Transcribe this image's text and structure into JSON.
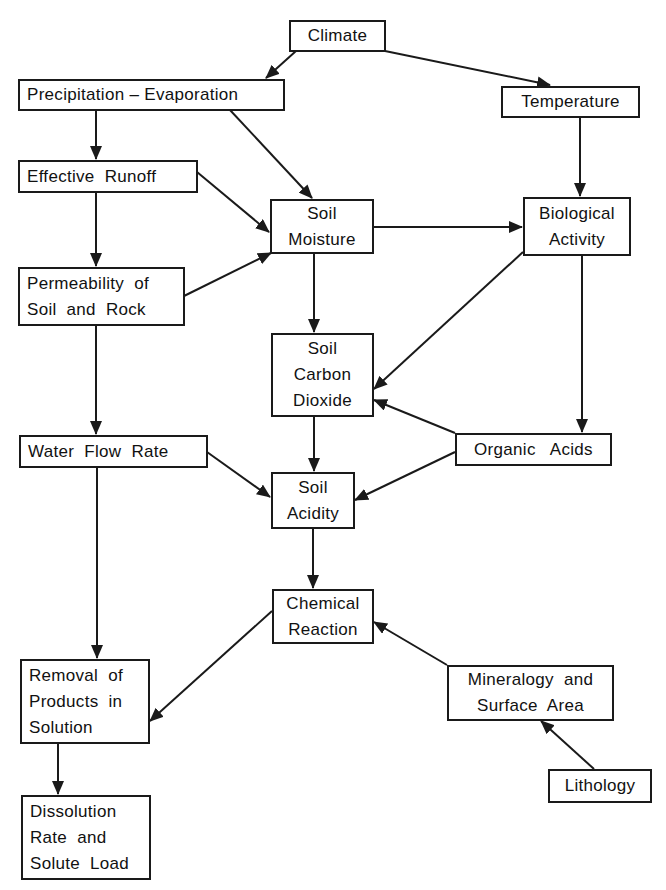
{
  "diagram": {
    "type": "flowchart",
    "nodes": [
      {
        "id": "climate",
        "lines": [
          "Climate"
        ]
      },
      {
        "id": "precip_evap",
        "lines": [
          "Precipitation – Evaporation"
        ]
      },
      {
        "id": "temperature",
        "lines": [
          "Temperature"
        ]
      },
      {
        "id": "effective_runoff",
        "lines": [
          "Effective  Runoff"
        ]
      },
      {
        "id": "soil_moisture",
        "lines": [
          "Soil",
          "Moisture"
        ]
      },
      {
        "id": "biological_activity",
        "lines": [
          "Biological",
          "Activity"
        ]
      },
      {
        "id": "permeability",
        "lines": [
          "Permeability  of",
          "Soil  and  Rock"
        ]
      },
      {
        "id": "soil_co2",
        "lines": [
          "Soil",
          "Carbon",
          "Dioxide"
        ]
      },
      {
        "id": "water_flow_rate",
        "lines": [
          "Water  Flow  Rate"
        ]
      },
      {
        "id": "organic_acids",
        "lines": [
          "Organic   Acids"
        ]
      },
      {
        "id": "soil_acidity",
        "lines": [
          "Soil",
          "Acidity"
        ]
      },
      {
        "id": "chemical_reaction",
        "lines": [
          "Chemical",
          "Reaction"
        ]
      },
      {
        "id": "mineralogy",
        "lines": [
          "Mineralogy  and",
          "Surface  Area"
        ]
      },
      {
        "id": "lithology",
        "lines": [
          "Lithology"
        ]
      },
      {
        "id": "removal",
        "lines": [
          "Removal  of",
          "Products  in",
          "Solution"
        ]
      },
      {
        "id": "dissolution",
        "lines": [
          "Dissolution",
          "Rate  and",
          "Solute  Load"
        ]
      }
    ],
    "edges": [
      {
        "from": "climate",
        "to": "precip_evap"
      },
      {
        "from": "climate",
        "to": "temperature"
      },
      {
        "from": "precip_evap",
        "to": "effective_runoff"
      },
      {
        "from": "precip_evap",
        "to": "soil_moisture"
      },
      {
        "from": "temperature",
        "to": "biological_activity"
      },
      {
        "from": "effective_runoff",
        "to": "soil_moisture"
      },
      {
        "from": "effective_runoff",
        "to": "permeability"
      },
      {
        "from": "permeability",
        "to": "soil_moisture"
      },
      {
        "from": "soil_moisture",
        "to": "biological_activity"
      },
      {
        "from": "soil_moisture",
        "to": "soil_co2"
      },
      {
        "from": "biological_activity",
        "to": "soil_co2"
      },
      {
        "from": "biological_activity",
        "to": "organic_acids"
      },
      {
        "from": "permeability",
        "to": "water_flow_rate"
      },
      {
        "from": "organic_acids",
        "to": "soil_co2"
      },
      {
        "from": "soil_co2",
        "to": "soil_acidity"
      },
      {
        "from": "water_flow_rate",
        "to": "soil_acidity"
      },
      {
        "from": "organic_acids",
        "to": "soil_acidity"
      },
      {
        "from": "soil_acidity",
        "to": "chemical_reaction"
      },
      {
        "from": "water_flow_rate",
        "to": "removal"
      },
      {
        "from": "chemical_reaction",
        "to": "removal"
      },
      {
        "from": "mineralogy",
        "to": "chemical_reaction"
      },
      {
        "from": "lithology",
        "to": "mineralogy"
      },
      {
        "from": "removal",
        "to": "dissolution"
      }
    ],
    "colors": {
      "line": "#1a1a1a",
      "background": "#ffffff"
    }
  }
}
